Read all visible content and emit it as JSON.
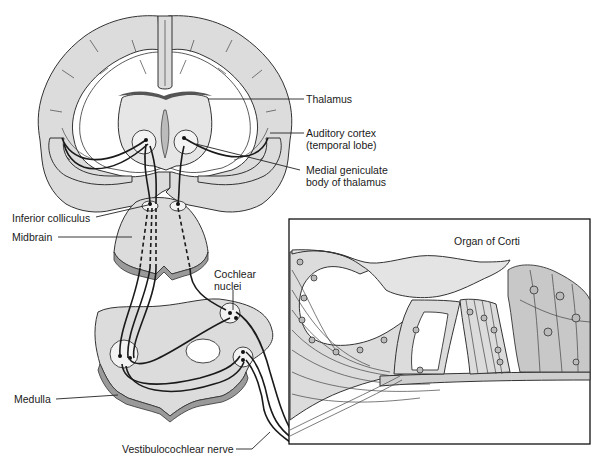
{
  "figure": {
    "labels": {
      "thalamus": "Thalamus",
      "auditory_cortex_line1": "Auditory cortex",
      "auditory_cortex_line2": "(temporal lobe)",
      "medial_geniculate_line1": "Medial geniculate",
      "medial_geniculate_line2": "body of thalamus",
      "inferior_colliculus": "Inferior colliculus",
      "midbrain": "Midbrain",
      "cochlear_nuclei_line1": "Cochlear",
      "cochlear_nuclei_line2": "nuclei",
      "medulla": "Medulla",
      "vestibulocochlear_nerve": "Vestibulocochlear nerve",
      "organ_of_corti": "Organ of Corti"
    },
    "colors": {
      "tissue": "#dcdcdc",
      "outline": "#333333",
      "pathway": "#1a1a1a",
      "background": "#ffffff"
    }
  }
}
